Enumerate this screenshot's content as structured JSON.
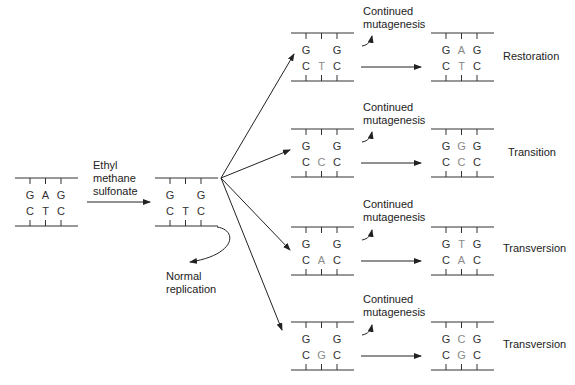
{
  "diagram": {
    "initial_duplex": {
      "top": [
        "G",
        "A",
        "G"
      ],
      "bottom": [
        "C",
        "T",
        "C"
      ],
      "highlight_top": [],
      "highlight_bottom": []
    },
    "treatment_label": "Ethyl\nmethane\nsulfonate",
    "damaged_duplex": {
      "top": [
        "G",
        "",
        "G"
      ],
      "bottom": [
        "C",
        "T",
        "C"
      ]
    },
    "normal_replication_label": "Normal\nreplication",
    "continued_label": "Continued\nmutagenesis",
    "rows": [
      {
        "middle": {
          "top": [
            "G",
            "",
            "G"
          ],
          "bottom": [
            "C",
            "T",
            "C"
          ],
          "hl_bottom": 1
        },
        "result": {
          "top": [
            "G",
            "A",
            "G"
          ],
          "bottom": [
            "C",
            "T",
            "C"
          ],
          "hl_top": 1,
          "hl_bottom": 1
        },
        "outcome": "Restoration"
      },
      {
        "middle": {
          "top": [
            "G",
            "",
            "G"
          ],
          "bottom": [
            "C",
            "C",
            "C"
          ],
          "hl_bottom": 1
        },
        "result": {
          "top": [
            "G",
            "G",
            "G"
          ],
          "bottom": [
            "C",
            "C",
            "C"
          ],
          "hl_top": 1,
          "hl_bottom": 1
        },
        "outcome": "Transition"
      },
      {
        "middle": {
          "top": [
            "G",
            "",
            "G"
          ],
          "bottom": [
            "C",
            "A",
            "C"
          ],
          "hl_bottom": 1
        },
        "result": {
          "top": [
            "G",
            "T",
            "G"
          ],
          "bottom": [
            "C",
            "A",
            "C"
          ],
          "hl_top": 1,
          "hl_bottom": 1
        },
        "outcome": "Transversion"
      },
      {
        "middle": {
          "top": [
            "G",
            "",
            "G"
          ],
          "bottom": [
            "C",
            "G",
            "C"
          ],
          "hl_bottom": 1
        },
        "result": {
          "top": [
            "G",
            "C",
            "G"
          ],
          "bottom": [
            "C",
            "G",
            "C"
          ],
          "hl_top": 1,
          "hl_bottom": 1
        },
        "outcome": "Transversion"
      }
    ],
    "colors": {
      "line": "#333333",
      "base": "#333333",
      "highlight": "#8a8a8a"
    }
  }
}
